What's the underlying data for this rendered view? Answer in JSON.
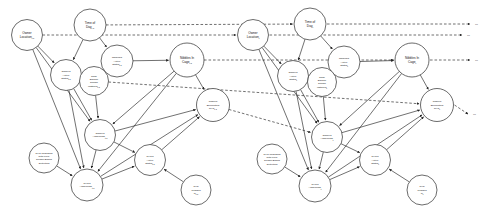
{
  "diagram": {
    "type": "dynamic-bayesian-network",
    "slice_count": 2,
    "continuation_marker": "⋯",
    "edge_styles": {
      "intra_slice": "solid",
      "inter_slice": "dashed"
    },
    "colors": {
      "node_fill": "#ffffff",
      "node_stroke": "#2b2b2b",
      "edge": "#242424",
      "background": "#ffffff",
      "label": "#141414"
    }
  },
  "slices": [
    {
      "id": "t-1",
      "subscript": "t-1",
      "nodes": [
        {
          "id": "owner_location",
          "label_lines": [
            "Owner",
            "Location"
          ],
          "sub": "t-1",
          "cx": 27,
          "cy": 35,
          "r": 15.5,
          "size": "lbl-2"
        },
        {
          "id": "time_of_day",
          "label_lines": [
            "Time of",
            "Day"
          ],
          "sub": "t-1",
          "cx": 90,
          "cy": 25,
          "r": 16,
          "size": "lbl-2"
        },
        {
          "id": "nibbles_active",
          "label_lines": [
            "Nibbles's",
            "Active",
            "Status"
          ],
          "sub": "t-1",
          "cx": 117,
          "cy": 61,
          "r": 16,
          "size": "lbl-3"
        },
        {
          "id": "nibbles_in_cage",
          "label_lines": [
            "Nibbles In",
            "Cage"
          ],
          "sub": "t-1",
          "cx": 187,
          "cy": 60,
          "r": 17,
          "size": "lbl-2"
        },
        {
          "id": "owner_active",
          "label_lines": [
            "Owner's",
            "Active",
            "Status"
          ],
          "sub": "t-1",
          "cx": 66,
          "cy": 75,
          "r": 15.5,
          "size": "lbl-3"
        },
        {
          "id": "cage_sensor",
          "label_lines": [
            "Cage",
            "Escape",
            "Sensor",
            "Installed"
          ],
          "sub": "t-1",
          "cx": 94,
          "cy": 81,
          "r": 14.5,
          "size": "lbl-3"
        },
        {
          "id": "nibbles_enc_rvc",
          "label_lines": [
            "Nibbles",
            "Encounters",
            "RVC"
          ],
          "sub": "t-1",
          "cx": 213,
          "cy": 105,
          "r": 16.5,
          "size": "lbl-3"
        },
        {
          "id": "owner_awareness",
          "label_lines": [
            "Owner's",
            "Awareness"
          ],
          "sub": "t-1",
          "cx": 100,
          "cy": 135,
          "r": 15.5,
          "size": "lbl-3"
        },
        {
          "id": "rvc_upgraded",
          "label_lines": [
            "RVC Upgraded",
            "with Floor",
            "Sensor-Based",
            "Detecting"
          ],
          "sub": "",
          "cx": 44,
          "cy": 158,
          "r": 15,
          "size": "lbl-3"
        },
        {
          "id": "rvc_awareness",
          "label_lines": [
            "RVC's",
            "Awareness"
          ],
          "sub": "t-1",
          "cx": 87,
          "cy": 185,
          "r": 16,
          "size": "lbl-3"
        },
        {
          "id": "rvc_active",
          "label_lines": [
            "RVC's",
            "Active",
            "Status"
          ],
          "sub": "t-1",
          "cx": 150,
          "cy": 160,
          "r": 15.5,
          "size": "lbl-3"
        },
        {
          "id": "rvc_plugged",
          "label_lines": [
            "RVC",
            "Plugged",
            "In"
          ],
          "sub": "t-1",
          "cx": 196,
          "cy": 190,
          "r": 15,
          "size": "lbl-3"
        }
      ]
    },
    {
      "id": "t",
      "subscript": "t",
      "nodes": [
        {
          "id": "owner_location",
          "label_lines": [
            "Owner",
            "Location"
          ],
          "sub": "t",
          "cx": 253,
          "cy": 35,
          "r": 15.5,
          "size": "lbl-2"
        },
        {
          "id": "time_of_day",
          "label_lines": [
            "Time of",
            "Day"
          ],
          "sub": "t",
          "cx": 310,
          "cy": 24,
          "r": 16,
          "size": "lbl-2"
        },
        {
          "id": "nibbles_active",
          "label_lines": [
            "Nibbles's",
            "Active",
            "Status"
          ],
          "sub": "t",
          "cx": 344,
          "cy": 62,
          "r": 16,
          "size": "lbl-3"
        },
        {
          "id": "nibbles_in_cage",
          "label_lines": [
            "Nibbles In",
            "Cage"
          ],
          "sub": "t",
          "cx": 412,
          "cy": 60,
          "r": 17,
          "size": "lbl-2"
        },
        {
          "id": "owner_active",
          "label_lines": [
            "Owner's",
            "Active",
            "Status"
          ],
          "sub": "t",
          "cx": 293,
          "cy": 76,
          "r": 15.5,
          "size": "lbl-3"
        },
        {
          "id": "cage_sensor",
          "label_lines": [
            "Cage",
            "Escape",
            "Sensor",
            "Installed"
          ],
          "sub": "t",
          "cx": 322,
          "cy": 82,
          "r": 14.5,
          "size": "lbl-3"
        },
        {
          "id": "nibbles_enc_rvc",
          "label_lines": [
            "Nibbles",
            "Encounters",
            "RVC"
          ],
          "sub": "t",
          "cx": 437,
          "cy": 105,
          "r": 16.5,
          "size": "lbl-3"
        },
        {
          "id": "owner_awareness",
          "label_lines": [
            "Owner's",
            "Awareness"
          ],
          "sub": "t",
          "cx": 327,
          "cy": 137,
          "r": 15.5,
          "size": "lbl-3"
        },
        {
          "id": "rvc_upgraded",
          "label_lines": [
            "RVC Upgraded",
            "with Floor",
            "Sensor-Based",
            "Detecting"
          ],
          "sub": "",
          "cx": 272,
          "cy": 159,
          "r": 15,
          "size": "lbl-3"
        },
        {
          "id": "rvc_awareness",
          "label_lines": [
            "RVC's",
            "Awareness"
          ],
          "sub": "t",
          "cx": 315,
          "cy": 186,
          "r": 16,
          "size": "lbl-3"
        },
        {
          "id": "rvc_active",
          "label_lines": [
            "RVC's",
            "Active",
            "Status"
          ],
          "sub": "t",
          "cx": 375,
          "cy": 160,
          "r": 15.5,
          "size": "lbl-3"
        },
        {
          "id": "rvc_plugged",
          "label_lines": [
            "RVC",
            "Plugged",
            "In"
          ],
          "sub": "t",
          "cx": 422,
          "cy": 190,
          "r": 15,
          "size": "lbl-3"
        }
      ]
    }
  ],
  "intra_slice_edges": [
    {
      "from": "owner_location",
      "to": "owner_active"
    },
    {
      "from": "owner_location",
      "to": "rvc_awareness"
    },
    {
      "from": "owner_location",
      "to": "owner_awareness"
    },
    {
      "from": "time_of_day",
      "to": "owner_active"
    },
    {
      "from": "time_of_day",
      "to": "nibbles_active"
    },
    {
      "from": "nibbles_active",
      "to": "nibbles_in_cage"
    },
    {
      "from": "owner_active",
      "to": "owner_awareness"
    },
    {
      "from": "owner_active",
      "to": "rvc_awareness"
    },
    {
      "from": "cage_sensor",
      "to": "owner_awareness"
    },
    {
      "from": "nibbles_in_cage",
      "to": "nibbles_enc_rvc"
    },
    {
      "from": "nibbles_in_cage",
      "to": "owner_awareness"
    },
    {
      "from": "nibbles_in_cage",
      "to": "rvc_awareness"
    },
    {
      "from": "owner_awareness",
      "to": "nibbles_enc_rvc"
    },
    {
      "from": "owner_awareness",
      "to": "rvc_awareness"
    },
    {
      "from": "owner_awareness",
      "to": "rvc_active"
    },
    {
      "from": "rvc_upgraded",
      "to": "rvc_awareness"
    },
    {
      "from": "rvc_awareness",
      "to": "rvc_active"
    },
    {
      "from": "rvc_awareness",
      "to": "nibbles_enc_rvc"
    },
    {
      "from": "rvc_active",
      "to": "nibbles_enc_rvc"
    },
    {
      "from": "rvc_plugged",
      "to": "rvc_active"
    }
  ],
  "inter_slice_edges": [
    {
      "from": "time_of_day",
      "to": "time_of_day"
    },
    {
      "from": "owner_location",
      "to": "owner_location"
    },
    {
      "from": "nibbles_in_cage",
      "to": "nibbles_in_cage"
    },
    {
      "from": "nibbles_enc_rvc",
      "to": "owner_awareness"
    },
    {
      "from": "cage_sensor",
      "to": "nibbles_enc_rvc"
    }
  ]
}
